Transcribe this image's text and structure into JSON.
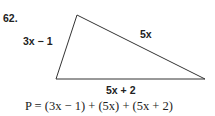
{
  "problem": {
    "number": "62.",
    "sides": {
      "left": "3x − 1",
      "hypotenuse": "5x",
      "base": "5x + 2"
    },
    "formula": "P = (3x − 1) + (5x) + (5x + 2)"
  }
}
